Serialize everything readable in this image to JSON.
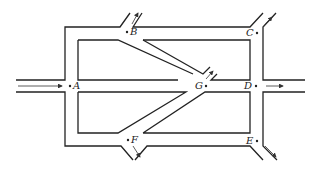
{
  "diagram": {
    "type": "road-network",
    "nodes": [
      {
        "id": "A",
        "label": "A",
        "x": 70,
        "y": 86
      },
      {
        "id": "B",
        "label": "B",
        "x": 127,
        "y": 32
      },
      {
        "id": "C",
        "label": "C",
        "x": 257,
        "y": 33
      },
      {
        "id": "D",
        "label": "D",
        "x": 256,
        "y": 86
      },
      {
        "id": "E",
        "label": "E",
        "x": 257,
        "y": 141
      },
      {
        "id": "F",
        "label": "F",
        "x": 128,
        "y": 140
      },
      {
        "id": "G",
        "label": "G",
        "x": 206,
        "y": 86
      }
    ],
    "flows": [
      {
        "at": "A",
        "direction": "in",
        "label": "entry from left"
      },
      {
        "at": "B",
        "direction": "out",
        "label": "exit up-right"
      },
      {
        "at": "C",
        "direction": "out",
        "label": "exit up-right"
      },
      {
        "at": "D",
        "direction": "out",
        "label": "exit right"
      },
      {
        "at": "E",
        "direction": "out",
        "label": "exit down-right"
      },
      {
        "at": "F",
        "direction": "out",
        "label": "exit down-right"
      },
      {
        "at": "G",
        "direction": "out",
        "label": "exit up-right"
      }
    ],
    "colors": {
      "line": "#222222",
      "background": "#ffffff"
    }
  }
}
